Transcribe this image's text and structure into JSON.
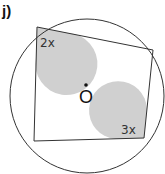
{
  "question": {
    "part_label": "j)"
  },
  "diagram": {
    "type": "cyclic-quadrilateral",
    "center_label": "O",
    "angles": [
      {
        "vertex": "top-left",
        "label": "2x"
      },
      {
        "vertex": "bottom-right",
        "label": "3x"
      }
    ],
    "colors": {
      "stroke": "#333333",
      "angle_fill": "#d0d0d0"
    }
  }
}
